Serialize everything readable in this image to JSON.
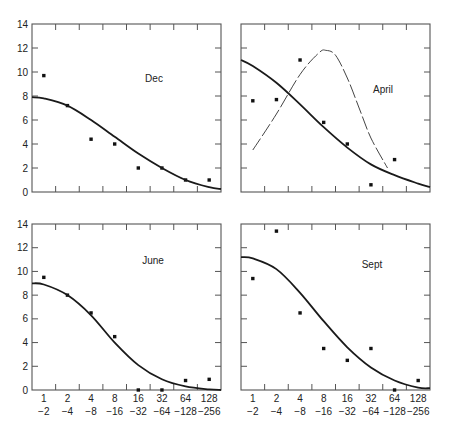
{
  "figure": {
    "panel_count": 4,
    "y_ticks": [
      "0",
      "2",
      "4",
      "6",
      "8",
      "10",
      "12",
      "14"
    ],
    "x_ticks_top_row": [
      "1",
      "2",
      "4",
      "8",
      "16",
      "32",
      "64",
      "128"
    ],
    "x_ticks_bottom_row": [
      "−2",
      "−4",
      "−8",
      "−16",
      "−32",
      "−64",
      "−128",
      "−256"
    ]
  },
  "chart_data": [
    {
      "type": "scatter",
      "title": "Dec",
      "panel_position": "top-left",
      "categories": [
        "1/-2",
        "2/-4",
        "4/-8",
        "8/-16",
        "16/-32",
        "32/-64",
        "64/-128",
        "128/-256"
      ],
      "series": [
        {
          "name": "observed",
          "style": "points",
          "values": [
            9.7,
            7.2,
            4.4,
            4.0,
            2.0,
            2.0,
            1.0,
            1.0
          ]
        },
        {
          "name": "fitted curve",
          "style": "solid-line",
          "x": [
            0.5,
            1,
            2,
            3,
            4,
            5,
            6,
            7,
            8,
            8.5
          ],
          "values": [
            7.9,
            7.8,
            7.2,
            6.0,
            4.6,
            3.2,
            2.0,
            1.0,
            0.4,
            0.25
          ]
        }
      ],
      "xlabel": "",
      "ylabel": "",
      "ylim": [
        0,
        14
      ],
      "grid": false,
      "legend": "none"
    },
    {
      "type": "scatter",
      "title": "April",
      "panel_position": "top-right",
      "categories": [
        "1/-2",
        "2/-4",
        "4/-8",
        "8/-16",
        "16/-32",
        "32/-64",
        "64/-128",
        "128/-256"
      ],
      "series": [
        {
          "name": "observed",
          "style": "points",
          "values": [
            7.6,
            7.7,
            11.0,
            5.8,
            4.0,
            0.6,
            2.7,
            null
          ]
        },
        {
          "name": "fitted curve",
          "style": "solid-line",
          "x": [
            0.5,
            1,
            2,
            3,
            4,
            5,
            6,
            7,
            8,
            8.5
          ],
          "values": [
            11.0,
            10.5,
            9.1,
            7.3,
            5.4,
            3.7,
            2.3,
            1.4,
            0.7,
            0.4
          ]
        },
        {
          "name": "dashed curve",
          "style": "dashed-line",
          "x": [
            1,
            2,
            3,
            3.8,
            4.1,
            4.5,
            5,
            5.5,
            6,
            6.7
          ],
          "values": [
            3.5,
            6.5,
            9.8,
            11.6,
            11.8,
            11.4,
            9.5,
            7.0,
            4.5,
            2.0
          ]
        }
      ],
      "xlabel": "",
      "ylabel": "",
      "ylim": [
        0,
        14
      ],
      "grid": false,
      "legend": "none"
    },
    {
      "type": "scatter",
      "title": "June",
      "panel_position": "bottom-left",
      "categories": [
        "1/-2",
        "2/-4",
        "4/-8",
        "8/-16",
        "16/-32",
        "32/-64",
        "64/-128",
        "128/-256"
      ],
      "series": [
        {
          "name": "observed",
          "style": "points",
          "values": [
            9.5,
            8.0,
            6.5,
            4.5,
            0.0,
            0.0,
            0.8,
            0.9
          ]
        },
        {
          "name": "fitted curve",
          "style": "solid-line",
          "x": [
            0.5,
            1,
            2,
            3,
            4,
            5,
            6,
            7,
            8,
            8.5
          ],
          "values": [
            9.0,
            8.9,
            8.0,
            6.3,
            4.0,
            2.1,
            0.9,
            0.3,
            0.05,
            0.0
          ]
        }
      ],
      "xlabel": "",
      "ylabel": "",
      "ylim": [
        0,
        14
      ],
      "grid": false,
      "legend": "none"
    },
    {
      "type": "scatter",
      "title": "Sept",
      "panel_position": "bottom-right",
      "categories": [
        "1/-2",
        "2/-4",
        "4/-8",
        "8/-16",
        "16/-32",
        "32/-64",
        "64/-128",
        "128/-256"
      ],
      "series": [
        {
          "name": "observed",
          "style": "points",
          "values": [
            9.4,
            13.4,
            6.5,
            3.5,
            2.5,
            3.5,
            0.0,
            0.8
          ]
        },
        {
          "name": "fitted curve",
          "style": "solid-line",
          "x": [
            0.5,
            1,
            2,
            3,
            4,
            5,
            6,
            7,
            8,
            8.5
          ],
          "values": [
            11.2,
            11.1,
            10.2,
            8.2,
            5.8,
            3.6,
            1.9,
            0.8,
            0.2,
            0.15
          ]
        }
      ],
      "xlabel": "",
      "ylabel": "",
      "ylim": [
        0,
        14
      ],
      "grid": false,
      "legend": "none"
    }
  ]
}
